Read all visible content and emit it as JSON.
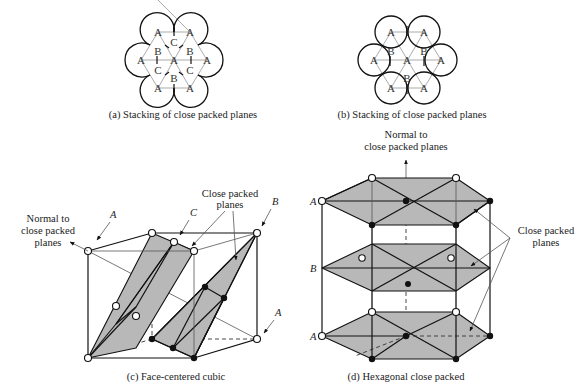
{
  "panels": {
    "a": {
      "caption": "(a) Stacking of close packed planes",
      "atom_labels": [
        "A",
        "A",
        "C",
        "B",
        "B",
        "A",
        "A",
        "A",
        "C",
        "C",
        "B",
        "A",
        "A"
      ]
    },
    "b": {
      "caption": "(b) Stacking of close packed planes",
      "atom_labels": [
        "A",
        "A",
        "B",
        "B",
        "A",
        "A",
        "A",
        "B",
        "A",
        "A"
      ]
    },
    "c": {
      "caption": "(c) Face-centered cubic",
      "normal_label": [
        "Normal to",
        "close packed",
        "planes"
      ],
      "planes_label": [
        "Close packed",
        "planes"
      ],
      "layer_labels": {
        "A_top": "A",
        "C": "C",
        "B": "B",
        "A_bottom": "A"
      }
    },
    "d": {
      "caption": "(d) Hexagonal close packed",
      "normal_label": [
        "Normal to",
        "close packed planes"
      ],
      "planes_label": [
        "Close packed",
        "planes"
      ],
      "layer_labels": {
        "top": "A",
        "middle": "B",
        "bottom": "A"
      }
    }
  }
}
